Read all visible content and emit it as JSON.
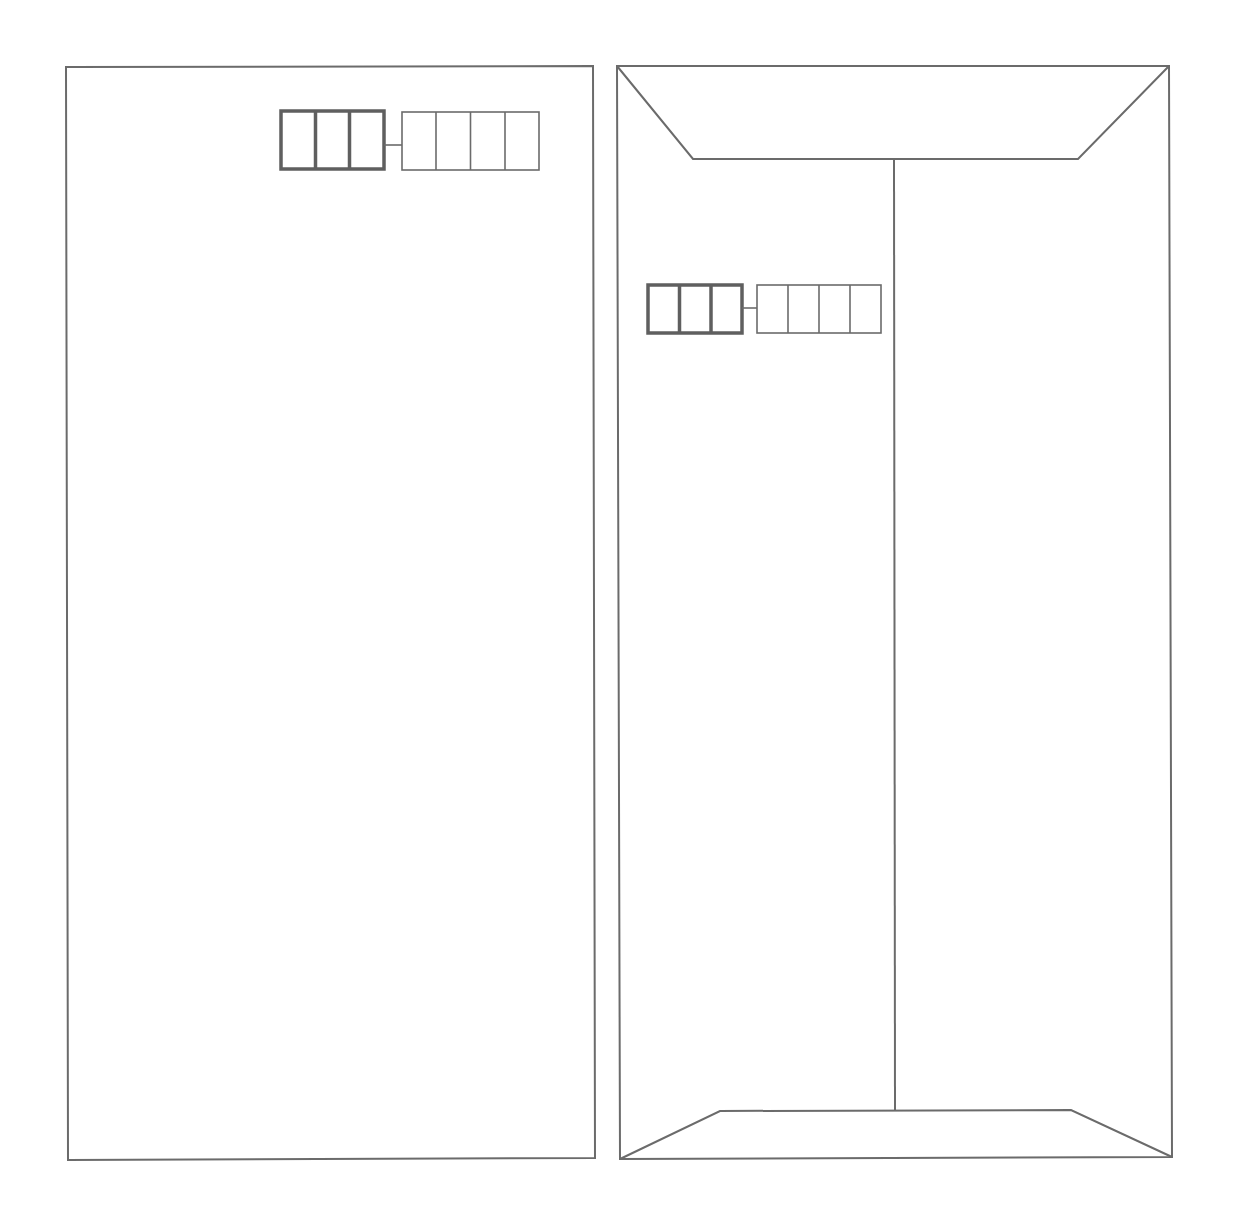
{
  "diagram": {
    "colors": {
      "background": "#ffffff",
      "line": "#6b6b6b",
      "thick_line": "#5f5f5f"
    },
    "front": {
      "label": "",
      "postal_code_boxes": {
        "thick_group_count": 3,
        "thin_group_count": 4
      }
    },
    "back": {
      "label": "",
      "has_top_flap": true,
      "has_bottom_flap": true,
      "has_center_seam": true,
      "postal_code_boxes": {
        "thick_group_count": 3,
        "thin_group_count": 4
      }
    }
  }
}
